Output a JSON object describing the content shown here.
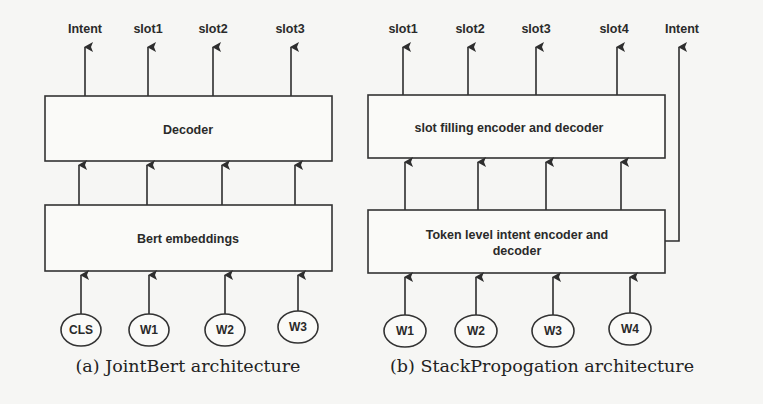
{
  "figure_a": {
    "caption": "(a) JointBert architecture",
    "outputs": [
      "Intent",
      "slot1",
      "slot2",
      "slot3"
    ],
    "upper_box": "Decoder",
    "lower_box": "Bert embeddings",
    "inputs": [
      "CLS",
      "W1",
      "W2",
      "W3"
    ]
  },
  "figure_b": {
    "caption": "(b) StackPropogation architecture",
    "outputs": [
      "slot1",
      "slot2",
      "slot3",
      "slot4"
    ],
    "intent_output": "Intent",
    "upper_box": "slot filling encoder and decoder",
    "lower_box_line1": "Token level intent encoder and",
    "lower_box_line2": "decoder",
    "inputs": [
      "W1",
      "W2",
      "W3",
      "W4"
    ]
  }
}
